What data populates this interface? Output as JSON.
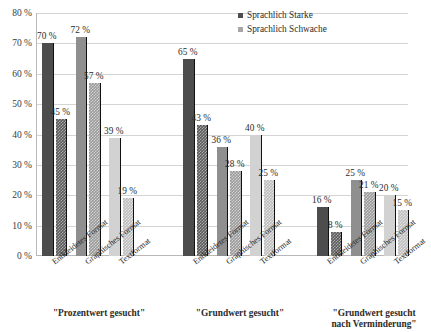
{
  "chart_data": {
    "type": "bar",
    "title": "",
    "xlabel": "",
    "ylabel": "",
    "ylim": [
      0,
      80
    ],
    "ytick_labels": [
      "80 %",
      "70 %",
      "60 %",
      "50 %",
      "40 %",
      "30 %",
      "20 %",
      "10 %",
      "0 %"
    ],
    "ytick_values": [
      80,
      70,
      60,
      50,
      40,
      30,
      20,
      10,
      0
    ],
    "grid": true,
    "legend_position": "top-right",
    "legend": [
      "Sprachlich Starke",
      "Sprachlich Schwache"
    ],
    "categories": [
      "Entkleidetes Format",
      "Graphisches Format",
      "Textformat"
    ],
    "groups": [
      {
        "label": "\"Prozentwert gesucht\"",
        "categories": [
          "Entkleidetes Format",
          "Graphisches Format",
          "Textformat"
        ],
        "bars": [
          {
            "category": "Entkleidetes Format",
            "series": "Sprachlich Starke",
            "value": 70,
            "label": "70 %"
          },
          {
            "category": "Entkleidetes Format",
            "series": "Sprachlich Schwache",
            "value": 45,
            "label": "45 %"
          },
          {
            "category": "Graphisches Format",
            "series": "Sprachlich Starke",
            "value": 72,
            "label": "72 %"
          },
          {
            "category": "Graphisches Format",
            "series": "Sprachlich Schwache",
            "value": 57,
            "label": "57 %"
          },
          {
            "category": "Textformat",
            "series": "Sprachlich Starke",
            "value": 39,
            "label": "39 %"
          },
          {
            "category": "Textformat",
            "series": "Sprachlich Schwache",
            "value": 19,
            "label": "19 %"
          }
        ]
      },
      {
        "label": "\"Grundwert gesucht\"",
        "categories": [
          "Entkleidetes Format",
          "Graphisches Format",
          "Textformat"
        ],
        "bars": [
          {
            "category": "Entkleidetes Format",
            "series": "Sprachlich Starke",
            "value": 65,
            "label": "65 %"
          },
          {
            "category": "Entkleidetes Format",
            "series": "Sprachlich Schwache",
            "value": 43,
            "label": "43 %"
          },
          {
            "category": "Graphisches Format",
            "series": "Sprachlich Starke",
            "value": 36,
            "label": "36 %"
          },
          {
            "category": "Graphisches Format",
            "series": "Sprachlich Schwache",
            "value": 28,
            "label": "28 %"
          },
          {
            "category": "Textformat",
            "series": "Sprachlich Starke",
            "value": 40,
            "label": "40 %"
          },
          {
            "category": "Textformat",
            "series": "Sprachlich Schwache",
            "value": 25,
            "label": "25 %"
          }
        ]
      },
      {
        "label": "\"Grundwert gesucht nach Verminderung\"",
        "label_line1": "\"Grundwert gesucht",
        "label_line2": "nach Verminderung\"",
        "categories": [
          "Entkleidetes Format",
          "Graphisches Format",
          "Textformat"
        ],
        "bars": [
          {
            "category": "Entkleidetes Format",
            "series": "Sprachlich Starke",
            "value": 16,
            "label": "16 %"
          },
          {
            "category": "Entkleidetes Format",
            "series": "Sprachlich Schwache",
            "value": 8,
            "label": "8 %"
          },
          {
            "category": "Graphisches Format",
            "series": "Sprachlich Starke",
            "value": 25,
            "label": "25 %"
          },
          {
            "category": "Graphisches Format",
            "series": "Sprachlich Schwache",
            "value": 21,
            "label": "21 %"
          },
          {
            "category": "Textformat",
            "series": "Sprachlich Starke",
            "value": 20,
            "label": "20 %"
          },
          {
            "category": "Textformat",
            "series": "Sprachlich Schwache",
            "value": 15,
            "label": "15 %"
          }
        ]
      }
    ],
    "series_styles": {
      "Sprachlich Starke": "solid",
      "Sprachlich Schwache": "hatched"
    },
    "colors": {
      "dark": "#4d4d4d",
      "dark_hatch": "#5c5c5c",
      "mid": "#8f8f8f",
      "mid_hatch": "#9a9a9a",
      "light": "#d2d2d2",
      "light_hatch": "#bdbdbd",
      "gridline": "#d4d4d4",
      "axis": "#b8b8b8",
      "text": "#2b2b2b"
    }
  }
}
